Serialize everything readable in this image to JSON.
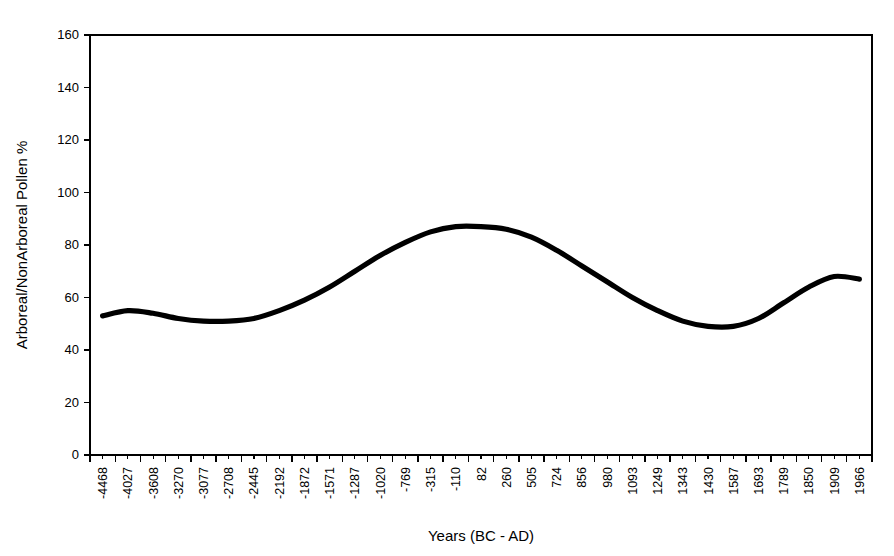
{
  "chart_data": {
    "type": "line",
    "title": "",
    "xlabel": "Years (BC - AD)",
    "ylabel": "Arboreal/NonArboreal Pollen %",
    "ylim": [
      0,
      160
    ],
    "yticks": [
      0,
      20,
      40,
      60,
      80,
      100,
      120,
      140,
      160
    ],
    "grid": false,
    "legend": "none",
    "categories": [
      "-4468",
      "-4027",
      "-3608",
      "-3270",
      "-3077",
      "-2708",
      "-2445",
      "-2192",
      "-1872",
      "-1571",
      "-1287",
      "-1020",
      "-769",
      "-315",
      "-110",
      "82",
      "260",
      "505",
      "724",
      "856",
      "980",
      "1093",
      "1249",
      "1343",
      "1430",
      "1587",
      "1693",
      "1789",
      "1850",
      "1909",
      "1966"
    ],
    "series": [
      {
        "name": "Arboreal/NonArboreal Pollen %",
        "values": [
          53,
          55,
          54,
          52,
          51,
          51,
          52,
          55,
          59,
          64,
          70,
          76,
          81,
          85,
          87,
          87,
          86,
          83,
          78,
          72,
          66,
          60,
          55,
          51,
          49,
          49,
          52,
          58,
          64,
          68,
          67
        ]
      }
    ]
  },
  "axes": {
    "y_title": "Arboreal/NonArboreal Pollen %",
    "x_title": "Years (BC - AD)"
  }
}
